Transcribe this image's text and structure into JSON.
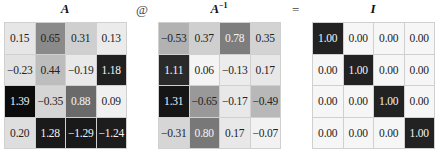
{
  "operators": {
    "matmul": "@",
    "equals": "="
  },
  "matrices": [
    {
      "id": "A",
      "title": "A",
      "superscript": "",
      "cells": [
        [
          {
            "v": "0.15",
            "bg": "#e6e6e6",
            "dark": false
          },
          {
            "v": "0.65",
            "bg": "#8a8a8a",
            "dark": false
          },
          {
            "v": "0.31",
            "bg": "#cfcfcf",
            "dark": false
          },
          {
            "v": "0.13",
            "bg": "#ebebeb",
            "dark": false
          }
        ],
        [
          {
            "v": "−0.23",
            "bg": "#e2e2e2",
            "dark": false
          },
          {
            "v": "0.44",
            "bg": "#bdbdbd",
            "dark": false
          },
          {
            "v": "−0.19",
            "bg": "#e9e9e9",
            "dark": false
          },
          {
            "v": "1.18",
            "bg": "#202020",
            "dark": true
          }
        ],
        [
          {
            "v": "1.39",
            "bg": "#0c0c0c",
            "dark": true
          },
          {
            "v": "−0.35",
            "bg": "#d5d5d5",
            "dark": false
          },
          {
            "v": "0.88",
            "bg": "#6a6a6a",
            "dark": true
          },
          {
            "v": "0.09",
            "bg": "#f0f0f0",
            "dark": false
          }
        ],
        [
          {
            "v": "0.20",
            "bg": "#dedede",
            "dark": false
          },
          {
            "v": "1.28",
            "bg": "#1a1a1a",
            "dark": true
          },
          {
            "v": "−1.29",
            "bg": "#191919",
            "dark": true
          },
          {
            "v": "−1.24",
            "bg": "#1d1d1d",
            "dark": true
          }
        ]
      ]
    },
    {
      "id": "A_inv",
      "title": "A",
      "superscript": "−1",
      "cells": [
        [
          {
            "v": "−0.53",
            "bg": "#b2b2b2",
            "dark": false
          },
          {
            "v": "0.37",
            "bg": "#cfcfcf",
            "dark": false
          },
          {
            "v": "0.78",
            "bg": "#7d7d7d",
            "dark": true
          },
          {
            "v": "0.35",
            "bg": "#d3d3d3",
            "dark": false
          }
        ],
        [
          {
            "v": "1.11",
            "bg": "#2a2a2a",
            "dark": true
          },
          {
            "v": "0.06",
            "bg": "#f4f4f4",
            "dark": false
          },
          {
            "v": "−0.13",
            "bg": "#ececec",
            "dark": false
          },
          {
            "v": "0.17",
            "bg": "#e8e8e8",
            "dark": false
          }
        ],
        [
          {
            "v": "1.31",
            "bg": "#151515",
            "dark": true
          },
          {
            "v": "−0.65",
            "bg": "#999999",
            "dark": false
          },
          {
            "v": "−0.17",
            "bg": "#e8e8e8",
            "dark": false
          },
          {
            "v": "−0.49",
            "bg": "#b8b8b8",
            "dark": false
          }
        ],
        [
          {
            "v": "−0.31",
            "bg": "#d6d6d6",
            "dark": false
          },
          {
            "v": "0.80",
            "bg": "#787878",
            "dark": true
          },
          {
            "v": "0.17",
            "bg": "#e8e8e8",
            "dark": false
          },
          {
            "v": "−0.07",
            "bg": "#f2f2f2",
            "dark": false
          }
        ]
      ]
    },
    {
      "id": "I",
      "title": "I",
      "superscript": "",
      "cells": [
        [
          {
            "v": "1.00",
            "bg": "#222222",
            "dark": true
          },
          {
            "v": "0.00",
            "bg": "#f6f6f6",
            "dark": false
          },
          {
            "v": "0.00",
            "bg": "#f6f6f6",
            "dark": false
          },
          {
            "v": "0.00",
            "bg": "#f6f6f6",
            "dark": false
          }
        ],
        [
          {
            "v": "0.00",
            "bg": "#f6f6f6",
            "dark": false
          },
          {
            "v": "1.00",
            "bg": "#222222",
            "dark": true
          },
          {
            "v": "0.00",
            "bg": "#f6f6f6",
            "dark": false
          },
          {
            "v": "0.00",
            "bg": "#f6f6f6",
            "dark": false
          }
        ],
        [
          {
            "v": "0.00",
            "bg": "#f6f6f6",
            "dark": false
          },
          {
            "v": "0.00",
            "bg": "#f6f6f6",
            "dark": false
          },
          {
            "v": "1.00",
            "bg": "#222222",
            "dark": true
          },
          {
            "v": "0.00",
            "bg": "#f6f6f6",
            "dark": false
          }
        ],
        [
          {
            "v": "0.00",
            "bg": "#f6f6f6",
            "dark": false
          },
          {
            "v": "0.00",
            "bg": "#f6f6f6",
            "dark": false
          },
          {
            "v": "0.00",
            "bg": "#f6f6f6",
            "dark": false
          },
          {
            "v": "1.00",
            "bg": "#222222",
            "dark": true
          }
        ]
      ]
    }
  ]
}
